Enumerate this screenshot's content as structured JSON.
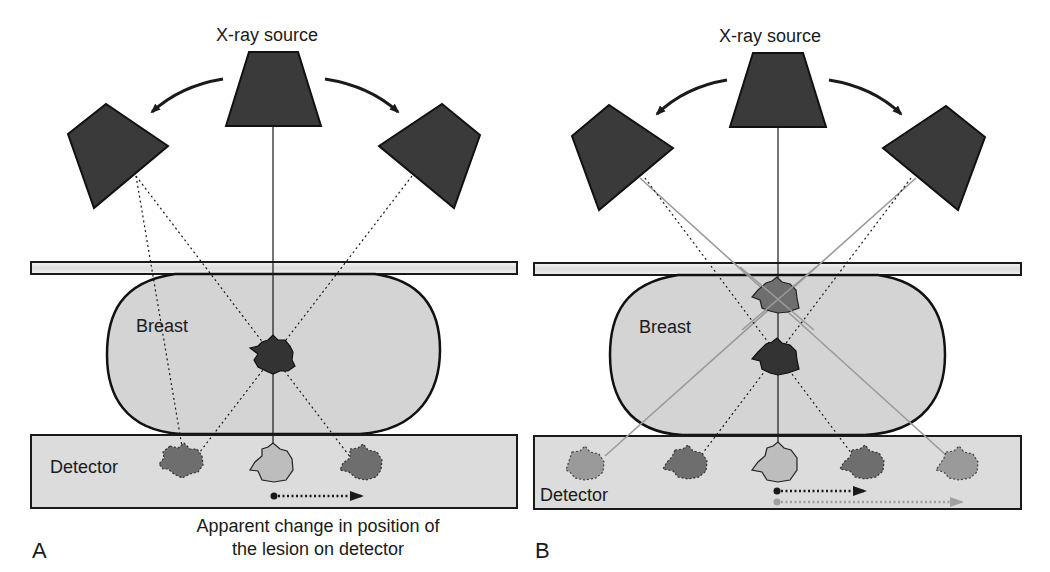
{
  "panels": [
    {
      "letter": "A",
      "source_label": "X-ray source",
      "breast_label": "Breast",
      "detector_label": "Detector",
      "caption_line1": "Apparent change in position of",
      "caption_line2": "the lesion on detector"
    },
    {
      "letter": "B",
      "source_label": "X-ray source",
      "breast_label": "Breast",
      "detector_label": "Detector"
    }
  ],
  "colors": {
    "source": "#3a3a3a",
    "breast": "#d4d4d4",
    "detector": "#dcdcdc",
    "lesion_dark": "#3c3c3c",
    "lesion_mid": "#6e6e6e",
    "lesion_light": "#bdbdbd",
    "lesion_far": "#9a9a9a",
    "gray_ray": "#9a9a9a"
  }
}
